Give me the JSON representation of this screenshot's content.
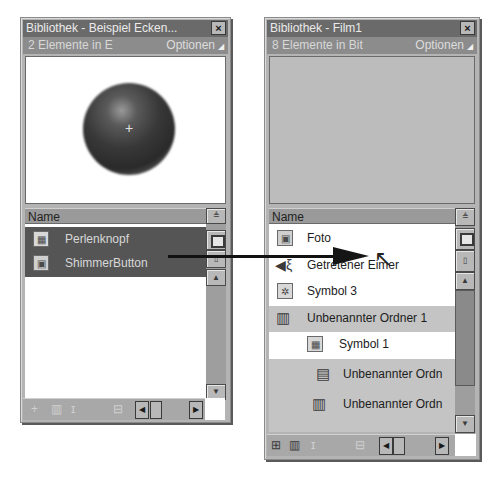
{
  "left_panel": {
    "title": "Bibliothek - Beispiel Ecken...",
    "close_icon": "×",
    "info": "2 Elemente in E",
    "options_label": "Optionen",
    "options_icon": "◢",
    "preview_crosshair": "+",
    "column_header": "Name",
    "items": [
      {
        "icon": "symbol-icon",
        "glyph": "▦",
        "label": "Perlenknopf",
        "state": "selected"
      },
      {
        "icon": "button-icon",
        "glyph": "▣",
        "label": "ShimmerButton",
        "state": "selected"
      }
    ],
    "scroll_up": "▲",
    "scroll_down": "▼",
    "scroll_left": "◀",
    "scroll_right": "▶",
    "sort_icon": "≜"
  },
  "right_panel": {
    "title": "Bibliothek - Film1",
    "close_icon": "×",
    "info": "8 Elemente in Bit",
    "options_label": "Optionen",
    "options_icon": "◢",
    "column_header": "Name",
    "items": [
      {
        "icon": "bitmap-icon",
        "glyph": "▣",
        "label": "Foto",
        "state": "plain",
        "indent": 0
      },
      {
        "icon": "sound-icon",
        "glyph": "🔈",
        "label": "Getretener Eimer",
        "state": "plain",
        "indent": 0
      },
      {
        "icon": "symbol-icon",
        "glyph": "✲",
        "label": "Symbol 3",
        "state": "plain",
        "indent": 0
      },
      {
        "icon": "folder-icon",
        "glyph": "▥",
        "label": "Unbenannter Ordner 1",
        "state": "shaded",
        "indent": 0
      },
      {
        "icon": "symbol-icon",
        "glyph": "▦",
        "label": "Symbol 1",
        "state": "plain",
        "indent": 1
      },
      {
        "icon": "folder-icon",
        "glyph": "▤",
        "label": "Unbenannter Ordn",
        "state": "shaded",
        "indent": 2
      },
      {
        "icon": "folder-icon",
        "glyph": "▥",
        "label": "Unbenannter Ordn",
        "state": "shaded",
        "indent": 2
      }
    ],
    "scroll_up": "▲",
    "scroll_down": "▼",
    "scroll_left": "◀",
    "scroll_right": "▶",
    "sort_icon": "≜",
    "footer_new_symbol": "⊞",
    "footer_new_folder": "▥"
  },
  "drag": {
    "cursor_icon": "↖"
  }
}
